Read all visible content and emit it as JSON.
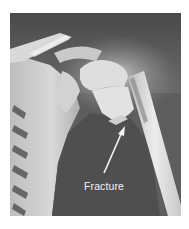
{
  "image": {
    "subject": "shoulder-xray",
    "annotation": {
      "label": "Fracture",
      "arrow": {
        "from": [
          104,
          173
        ],
        "to": [
          124,
          128
        ]
      }
    },
    "colors": {
      "background": "#5e5e5e",
      "bone_light": "#e6e6e6",
      "label_text": "#f2f2f2"
    }
  }
}
